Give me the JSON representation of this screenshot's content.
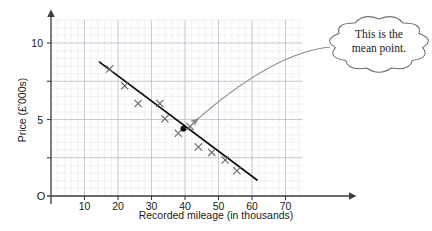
{
  "chart_data": {
    "type": "scatter",
    "title": "",
    "xlabel": "Recorded mileage (in thousands)",
    "ylabel": "Price (£'000s)",
    "origin_label": "O",
    "xlim": [
      0,
      75
    ],
    "ylim": [
      0,
      11.5
    ],
    "xticks": [
      10,
      20,
      30,
      40,
      50,
      60,
      70
    ],
    "xtick_labels": [
      "10",
      "20",
      "30",
      "40",
      "50",
      "60",
      "70"
    ],
    "yticks": [
      5,
      10
    ],
    "ytick_labels": [
      "5",
      "10"
    ],
    "grid": true,
    "grid_major_x_step": 10,
    "grid_major_y_step": 2.5,
    "grid_minor": true,
    "legend": "none",
    "points": [
      {
        "x": 17.5,
        "y": 8.3
      },
      {
        "x": 22.0,
        "y": 7.2
      },
      {
        "x": 26.0,
        "y": 6.05
      },
      {
        "x": 32.5,
        "y": 6.05
      },
      {
        "x": 34.0,
        "y": 5.05
      },
      {
        "x": 38.0,
        "y": 4.1
      },
      {
        "x": 41.5,
        "y": 4.55
      },
      {
        "x": 44.0,
        "y": 3.2
      },
      {
        "x": 48.0,
        "y": 2.85
      },
      {
        "x": 52.0,
        "y": 2.35
      },
      {
        "x": 55.5,
        "y": 1.65
      }
    ],
    "mean_point": {
      "x": 39.5,
      "y": 4.4
    },
    "regression_line": {
      "x1": 14.5,
      "y1": 8.75,
      "x2": 61.5,
      "y2": 1.05
    },
    "annotation": {
      "text_line1": "This is the",
      "text_line2": "mean point.",
      "shape": "cloud",
      "points_to": "mean_point"
    }
  },
  "colors": {
    "axis": "#3d3d3d",
    "grid_major": "#b9b9c4",
    "grid_minor": "#e2e2ec",
    "line": "#111111",
    "marker": "#6a6a6a",
    "mean_marker": "#111111",
    "arrow": "#8a8a8a",
    "callout_stroke": "#6e6e6e",
    "text": "#1a1a1a",
    "background": "#ffffff"
  }
}
